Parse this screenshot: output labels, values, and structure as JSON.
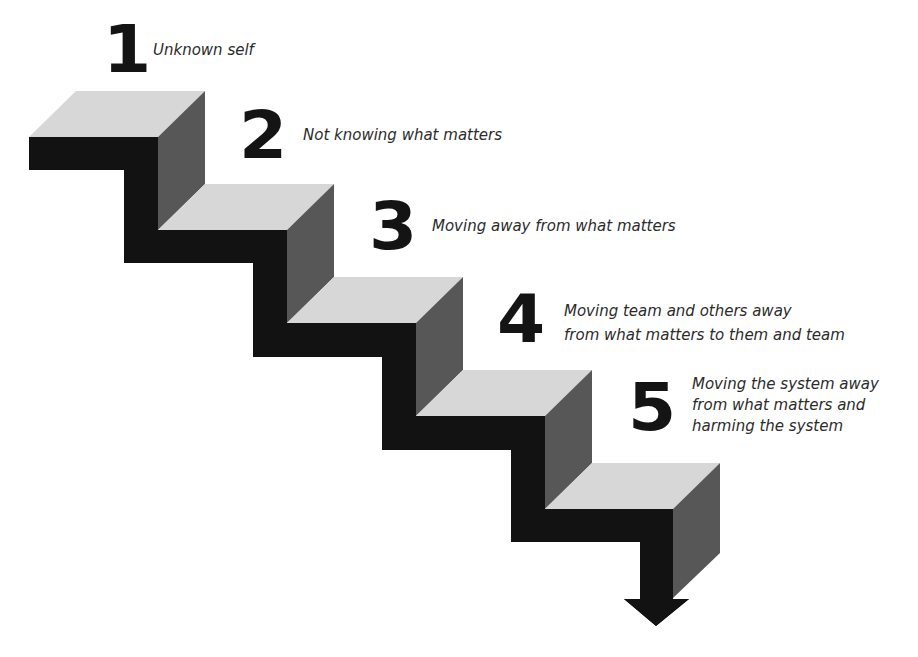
{
  "diagram": {
    "type": "descending-staircase",
    "colors": {
      "top_face": "#d7d7d7",
      "side_face": "#575757",
      "front_face": "#121212",
      "number": "#141414",
      "label_text": "#2b2b2b",
      "background": "#ffffff"
    },
    "steps": [
      {
        "number": "1",
        "label_lines": [
          "Unknown self"
        ]
      },
      {
        "number": "2",
        "label_lines": [
          "Not knowing what matters"
        ]
      },
      {
        "number": "3",
        "label_lines": [
          "Moving away from what matters"
        ]
      },
      {
        "number": "4",
        "label_lines": [
          "Moving team and others away",
          "from what matters to them and team"
        ]
      },
      {
        "number": "5",
        "label_lines": [
          "Moving the system away",
          "from what matters and",
          "harming the system"
        ]
      }
    ],
    "arrow": "down-arrow"
  }
}
